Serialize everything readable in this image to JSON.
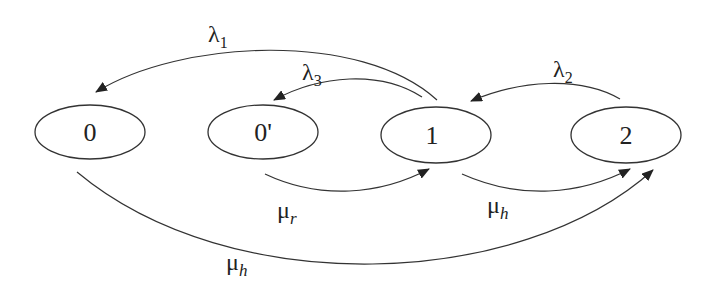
{
  "diagram": {
    "type": "state-transition",
    "nodes": [
      {
        "id": "s0",
        "label": "0"
      },
      {
        "id": "s0p",
        "label": "0'"
      },
      {
        "id": "s1",
        "label": "1"
      },
      {
        "id": "s2",
        "label": "2"
      }
    ],
    "edges": [
      {
        "from": "s1",
        "to": "s0",
        "symbol": "λ",
        "sub": "1"
      },
      {
        "from": "s1",
        "to": "s0p",
        "symbol": "λ",
        "sub": "3"
      },
      {
        "from": "s2",
        "to": "s1",
        "symbol": "λ",
        "sub": "2"
      },
      {
        "from": "s0p",
        "to": "s1",
        "symbol": "μ",
        "sub": "r"
      },
      {
        "from": "s1",
        "to": "s2",
        "symbol": "μ",
        "sub": "h"
      },
      {
        "from": "s0",
        "to": "s2",
        "symbol": "μ",
        "sub": "h"
      }
    ]
  }
}
